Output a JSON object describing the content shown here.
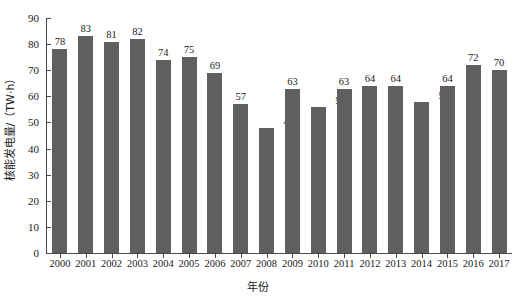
{
  "chart_data": {
    "type": "bar",
    "title": "",
    "xlabel": "年份",
    "ylabel": "核能发电量/（TW·h）",
    "categories": [
      "2000",
      "2001",
      "2002",
      "2003",
      "2004",
      "2005",
      "2006",
      "2007",
      "2008",
      "2009",
      "2010",
      "2011",
      "2012",
      "2013",
      "2014",
      "2015",
      "2016",
      "2017"
    ],
    "values": [
      78,
      83,
      81,
      82,
      74,
      75,
      69,
      57,
      48,
      63,
      56,
      63,
      64,
      64,
      58,
      64,
      72,
      70
    ],
    "ylim": [
      0,
      90
    ],
    "ytick_labels": [
      "0",
      "10",
      "20",
      "30",
      "40",
      "50",
      "60",
      "70",
      "80",
      "90"
    ],
    "ytick_values": [
      0,
      10,
      20,
      30,
      40,
      50,
      60,
      70,
      80,
      90
    ],
    "grid": false,
    "legend": null,
    "bar_color": "#5f5f5f",
    "axis_color": "#4a4a4a",
    "data_labels_shown": true
  }
}
